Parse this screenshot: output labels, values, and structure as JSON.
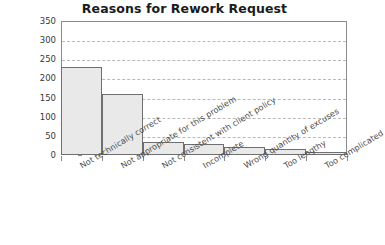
{
  "chart_data": {
    "type": "bar",
    "title": "Reasons for Rework Request",
    "xlabel": "",
    "ylabel": "",
    "categories": [
      "Not technically correct",
      "Not appropriate for this problem",
      "Not consistent with client policy",
      "Incomplete",
      "Wrong quantity of excuses",
      "Too lengthy",
      "Too complicated"
    ],
    "values": [
      230,
      160,
      34,
      28,
      21,
      16,
      7
    ],
    "ylim": [
      0,
      350
    ],
    "yticks": [
      0,
      50,
      100,
      150,
      200,
      250,
      300,
      350
    ],
    "ytick_labels": [
      "0",
      "50",
      "100",
      "150",
      "200",
      "250",
      "300",
      "350"
    ],
    "grid": true,
    "legend": false,
    "colors": {
      "bar_fill": "#e9e9e9",
      "bar_edge": "#6f6f6f",
      "gridline": "#b9b9b9",
      "axis": "#8a8a8a",
      "title_text": "#1b1b1b",
      "tick_text": "#3a3a3a",
      "category_text": "#4a4a4a",
      "background": "#ffffff"
    }
  }
}
